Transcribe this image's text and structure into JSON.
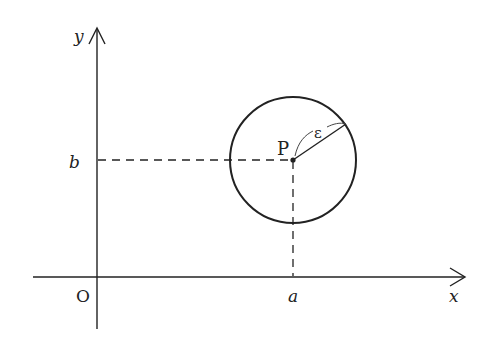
{
  "diagram": {
    "type": "coordinate-neighborhood",
    "colors": {
      "stroke": "#222222",
      "background": "#ffffff"
    },
    "axes": {
      "x_label": "x",
      "y_label": "y",
      "origin_label": "O"
    },
    "point": {
      "label": "P",
      "x_coord_label": "a",
      "y_coord_label": "b"
    },
    "circle": {
      "radius_label": "ε"
    }
  }
}
